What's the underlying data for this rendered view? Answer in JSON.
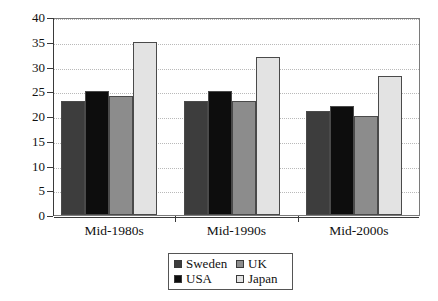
{
  "chart_data": {
    "type": "bar",
    "title": "",
    "subtitle": "",
    "xlabel": "",
    "ylabel": "",
    "categories": [
      "Mid-1980s",
      "Mid-1990s",
      "Mid-2000s"
    ],
    "series": [
      {
        "name": "Sweden",
        "color": "#3d3d3d",
        "values": [
          23,
          23,
          21
        ]
      },
      {
        "name": "USA",
        "color": "#0d0d0d",
        "values": [
          25,
          25,
          22
        ]
      },
      {
        "name": "UK",
        "color": "#8c8c8c",
        "values": [
          24,
          23,
          20
        ]
      },
      {
        "name": "Japan",
        "color": "#e3e3e3",
        "values": [
          35,
          32,
          28
        ]
      }
    ],
    "ylim": [
      0,
      40
    ],
    "ytick_step": 5,
    "yticks": [
      "40",
      "35",
      "30",
      "25",
      "20",
      "15",
      "10",
      "5",
      "0"
    ],
    "grid": true,
    "grid_axis": "y",
    "legend_position": "bottom-center",
    "legend_order": [
      "Sweden",
      "UK",
      "USA",
      "Japan"
    ]
  },
  "legend": {
    "entries": [
      {
        "label": "Sweden",
        "swatch": "#3d3d3d"
      },
      {
        "label": "UK",
        "swatch": "#8c8c8c"
      },
      {
        "label": "USA",
        "swatch": "#0d0d0d"
      },
      {
        "label": "Japan",
        "swatch": "#e3e3e3"
      }
    ]
  }
}
